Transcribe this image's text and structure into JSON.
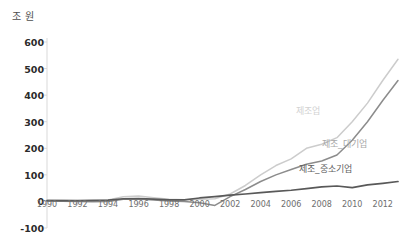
{
  "chart_data": {
    "type": "line",
    "title": "",
    "xlabel": "",
    "ylabel": "조 원",
    "ylim": [
      -100,
      600
    ],
    "xlim": [
      1990,
      2013
    ],
    "grid": false,
    "legend_position": "inline-right",
    "ytick_labels": [
      "600",
      "500",
      "400",
      "300",
      "200",
      "100",
      "0",
      "-100"
    ],
    "ytick_values": [
      600,
      500,
      400,
      300,
      200,
      100,
      0,
      -100
    ],
    "xtick_labels": [
      "1990",
      "1992",
      "1994",
      "1996",
      "1998",
      "2000",
      "2002",
      "2004",
      "2006",
      "2008",
      "2010",
      "2012"
    ],
    "xtick_values": [
      1990,
      1992,
      1994,
      1996,
      1998,
      2000,
      2002,
      2004,
      2006,
      2008,
      2010,
      2012
    ],
    "x": [
      1990,
      1991,
      1992,
      1993,
      1994,
      1995,
      1996,
      1997,
      1998,
      1999,
      2000,
      2001,
      2002,
      2003,
      2004,
      2005,
      2006,
      2007,
      2008,
      2009,
      2010,
      2011,
      2012,
      2013
    ],
    "series": [
      {
        "name": "제조업",
        "color": "#cccccc",
        "values": [
          5,
          4,
          3,
          3,
          5,
          18,
          20,
          14,
          8,
          6,
          8,
          10,
          28,
          60,
          100,
          135,
          160,
          200,
          215,
          240,
          300,
          370,
          455,
          535
        ]
      },
      {
        "name": "제조_대기업",
        "color": "#8c8c8c",
        "values": [
          2,
          1,
          0,
          -1,
          0,
          8,
          9,
          5,
          2,
          0,
          -5,
          -15,
          18,
          45,
          75,
          100,
          120,
          140,
          152,
          175,
          230,
          300,
          380,
          455
        ]
      },
      {
        "name": "제조_중소기업",
        "color": "#595959",
        "values": [
          3,
          3,
          3,
          4,
          5,
          10,
          11,
          9,
          6,
          6,
          13,
          18,
          24,
          28,
          33,
          38,
          42,
          48,
          55,
          58,
          52,
          62,
          68,
          75
        ]
      }
    ],
    "annotations": [
      {
        "text": "제조업",
        "x": 2009,
        "y": 320,
        "color": "#d2d2d2"
      },
      {
        "text": "제조_대기업",
        "x": 2010.2,
        "y": 205,
        "color": "#a8a8a8"
      },
      {
        "text": "제조_중소기업",
        "x": 2009.3,
        "y": 115,
        "color": "#5f5f5f"
      }
    ]
  },
  "axis": {
    "unit_label": "조 원"
  }
}
